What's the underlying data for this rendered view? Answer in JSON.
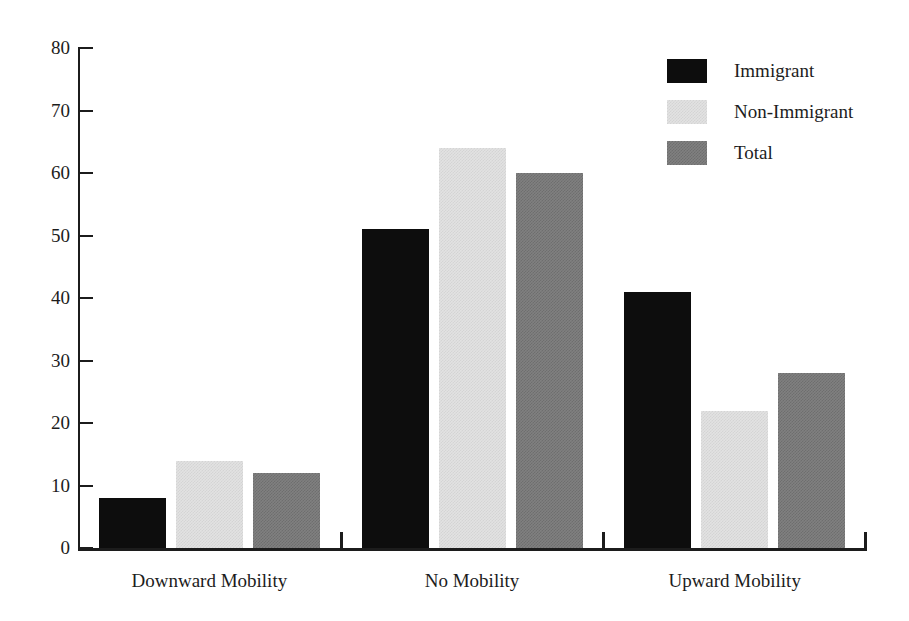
{
  "chart_data": {
    "type": "bar",
    "title": "",
    "subtitle": "",
    "xlabel": "",
    "ylabel": "",
    "categories": [
      "Downward Mobility",
      "No Mobility",
      "Upward Mobility"
    ],
    "series": [
      {
        "name": "Immigrant",
        "color": "#0d0d0d",
        "values": [
          8,
          51,
          41
        ]
      },
      {
        "name": "Non-Immigrant",
        "color": "#e2e2e2",
        "values": [
          14,
          64,
          22
        ]
      },
      {
        "name": "Total",
        "color": "#808080",
        "values": [
          12,
          60,
          28
        ]
      }
    ],
    "ylim": [
      0,
      80
    ],
    "ytick_step": 10,
    "yticks": [
      0,
      10,
      20,
      30,
      40,
      50,
      60,
      70,
      80
    ],
    "ytick_labels": [
      "0",
      "10",
      "20",
      "30",
      "40",
      "50",
      "60",
      "70",
      "80"
    ],
    "grid": false,
    "legend_position": "top-right",
    "annotations": []
  },
  "legend": {
    "entries": [
      {
        "label": "Immigrant",
        "swatch": "immigrant"
      },
      {
        "label": "Non-Immigrant",
        "swatch": "nonimmigrant"
      },
      {
        "label": "Total",
        "swatch": "total"
      }
    ]
  },
  "colors": {
    "axis": "#1c1c1c",
    "background": "#ffffff",
    "immigrant": "#0d0d0d",
    "non_immigrant": "#e2e2e2",
    "total": "#808080"
  }
}
